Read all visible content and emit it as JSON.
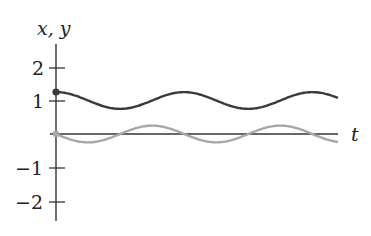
{
  "chart_data": {
    "type": "line",
    "title": "",
    "xlabel": "t",
    "ylabel": "x, y",
    "ylim": [
      -2.5,
      2.7
    ],
    "yticks": [
      2,
      1,
      -1,
      -2
    ],
    "ytick_labels": [
      "2",
      "1",
      "−1",
      "−2"
    ],
    "xticks": [],
    "grid": false,
    "legend": null,
    "series": [
      {
        "name": "x",
        "color": "#3a3a3a",
        "description": "x(t) = 1 + 0.25 cos(ωt), starts at 1.25 with filled dot",
        "mean": 1.0,
        "amplitude": 0.25,
        "initial_value": 1.25,
        "periods_shown": 2.2
      },
      {
        "name": "y",
        "color": "#a8a8a8",
        "description": "y(t) = -0.25 sin(ωt), starts at 0 with dot",
        "mean": 0.0,
        "amplitude": 0.25,
        "initial_value": 0.0,
        "periods_shown": 2.2
      }
    ]
  },
  "labels": {
    "y_axis": "x, y",
    "t_axis": "t",
    "tick_2": "2",
    "tick_1": "1",
    "tick_m1": "−1",
    "tick_m2": "−2"
  },
  "colors": {
    "axis": "#333333",
    "x_curve": "#3a3a3a",
    "y_curve": "#a8a8a8"
  }
}
